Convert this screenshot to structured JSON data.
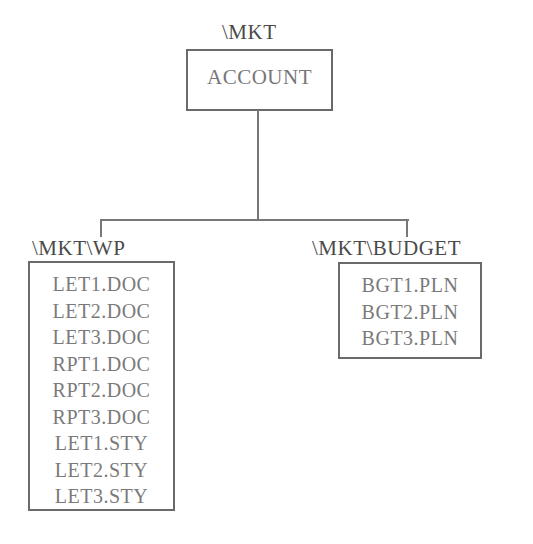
{
  "root": {
    "path_label": "\\MKT",
    "name": "ACCOUNT"
  },
  "children": [
    {
      "path_label": "\\MKT\\WP",
      "files": [
        "LET1.DOC",
        "LET2.DOC",
        "LET3.DOC",
        "RPT1.DOC",
        "RPT2.DOC",
        "RPT3.DOC",
        "LET1.STY",
        "LET2.STY",
        "LET3.STY"
      ]
    },
    {
      "path_label": "\\MKT\\BUDGET",
      "files": [
        "BGT1.PLN",
        "BGT2.PLN",
        "BGT3.PLN"
      ]
    }
  ],
  "colors": {
    "line": "#777777",
    "box_border": "#6a6a6a",
    "text": "#7a7a7a"
  }
}
